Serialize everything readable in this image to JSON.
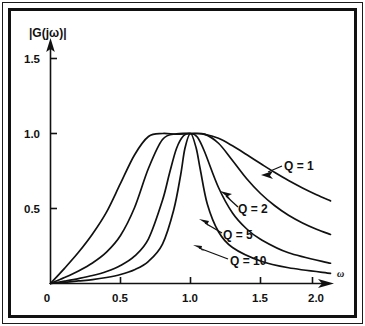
{
  "figure": {
    "background_color": "#ffffff",
    "frame_color": "#111111",
    "curve_color": "#111111"
  },
  "chart_data": {
    "type": "line",
    "title": "",
    "subtitle": "",
    "xlabel": "ω",
    "ylabel": "|G(jω)|",
    "xlim": [
      0,
      2.0
    ],
    "ylim": [
      0,
      1.6
    ],
    "grid": false,
    "legend_position": "inline-annotations",
    "x_ticks": [
      0,
      0.5,
      1.0,
      1.5,
      2.0
    ],
    "x_tick_labels": [
      "0",
      "0.5",
      "1.0",
      "1.5",
      "2.0"
    ],
    "y_ticks": [
      0.5,
      1.0,
      1.5
    ],
    "y_tick_labels": [
      "0.5",
      "1.0",
      "1.5"
    ],
    "series": [
      {
        "name": "Q = 1",
        "label": "Q = 1",
        "q": 1,
        "peak": {
          "x": 1.0,
          "y": 1.0
        },
        "x": [
          0.0,
          0.1,
          0.2,
          0.3,
          0.4,
          0.5,
          0.6,
          0.7,
          0.8,
          0.9,
          1.0,
          1.1,
          1.2,
          1.3,
          1.4,
          1.5,
          1.6,
          1.7,
          1.8,
          1.9,
          2.0
        ],
        "y": [
          0.0,
          0.101,
          0.208,
          0.33,
          0.476,
          0.667,
          0.857,
          0.98,
          1.0,
          0.995,
          1.0,
          0.994,
          0.968,
          0.918,
          0.86,
          0.8,
          0.741,
          0.686,
          0.637,
          0.592,
          0.551
        ]
      },
      {
        "name": "Q = 2",
        "label": "Q = 2",
        "q": 2,
        "peak": {
          "x": 1.0,
          "y": 1.0
        },
        "x": [
          0.0,
          0.1,
          0.2,
          0.3,
          0.4,
          0.5,
          0.6,
          0.7,
          0.8,
          0.9,
          1.0,
          1.1,
          1.2,
          1.3,
          1.4,
          1.5,
          1.6,
          1.7,
          1.8,
          1.9,
          2.0
        ],
        "y": [
          0.0,
          0.04,
          0.084,
          0.137,
          0.209,
          0.32,
          0.505,
          0.768,
          0.96,
          0.998,
          1.0,
          0.996,
          0.935,
          0.82,
          0.7,
          0.6,
          0.52,
          0.455,
          0.404,
          0.362,
          0.327
        ]
      },
      {
        "name": "Q = 5",
        "label": "Q = 5",
        "q": 5,
        "peak": {
          "x": 1.0,
          "y": 1.0
        },
        "x": [
          0.0,
          0.1,
          0.2,
          0.3,
          0.4,
          0.5,
          0.6,
          0.7,
          0.8,
          0.85,
          0.9,
          0.95,
          1.0,
          1.05,
          1.1,
          1.2,
          1.3,
          1.4,
          1.5,
          1.7,
          2.0
        ],
        "y": [
          0.0,
          0.016,
          0.033,
          0.053,
          0.08,
          0.12,
          0.182,
          0.298,
          0.555,
          0.735,
          0.9,
          0.985,
          1.0,
          0.975,
          0.88,
          0.64,
          0.47,
          0.365,
          0.295,
          0.205,
          0.135
        ]
      },
      {
        "name": "Q = 10",
        "label": "Q = 10",
        "q": 10,
        "peak": {
          "x": 1.0,
          "y": 1.0
        },
        "x": [
          0.0,
          0.1,
          0.2,
          0.3,
          0.4,
          0.5,
          0.6,
          0.7,
          0.8,
          0.88,
          0.93,
          0.96,
          1.0,
          1.04,
          1.07,
          1.12,
          1.2,
          1.3,
          1.5,
          1.7,
          2.0
        ],
        "y": [
          0.0,
          0.008,
          0.017,
          0.026,
          0.04,
          0.06,
          0.092,
          0.148,
          0.263,
          0.49,
          0.725,
          0.9,
          1.0,
          0.905,
          0.76,
          0.53,
          0.345,
          0.24,
          0.15,
          0.105,
          0.068
        ]
      }
    ],
    "annotations": [
      {
        "text": "Q = 1",
        "x": 1.62,
        "y": 0.72
      },
      {
        "text": "Q = 2",
        "x": 1.31,
        "y": 0.47
      },
      {
        "text": "Q = 5",
        "x": 1.17,
        "y": 0.27
      },
      {
        "text": "Q = 10",
        "x": 1.3,
        "y": 0.14
      }
    ]
  },
  "axis": {
    "y_axis_name": "|G(jω)|",
    "x_axis_name": "ω"
  },
  "ticks": {
    "y": [
      {
        "label": "1.5"
      },
      {
        "label": "1.0"
      },
      {
        "label": "0.5"
      }
    ],
    "x": [
      {
        "label": "0"
      },
      {
        "label": "0.5"
      },
      {
        "label": "1.0"
      },
      {
        "label": "1.5"
      },
      {
        "label": "2.0"
      }
    ]
  },
  "annotation_labels": {
    "q1": "Q = 1",
    "q2": "Q = 2",
    "q5": "Q = 5",
    "q10": "Q = 10"
  }
}
